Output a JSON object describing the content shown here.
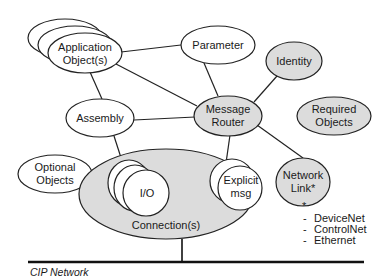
{
  "diagram": {
    "colors": {
      "required_fill": "#dcdcdc",
      "optional_fill": "#ffffff",
      "stroke": "#222222"
    },
    "nodes": {
      "application_objects": {
        "line1": "Application",
        "line2": "Object(s)"
      },
      "parameter": {
        "label": "Parameter"
      },
      "identity": {
        "label": "Identity"
      },
      "message_router": {
        "line1": "Message",
        "line2": "Router"
      },
      "required_objects": {
        "line1": "Required",
        "line2": "Objects"
      },
      "assembly": {
        "label": "Assembly"
      },
      "optional_objects": {
        "line1": "Optional",
        "line2": "Objects"
      },
      "connections": {
        "label": "Connection(s)"
      },
      "io": {
        "label": "I/O"
      },
      "explicit_msg": {
        "line1": "Explicit",
        "line2": "msg"
      },
      "network_link": {
        "line1": "Network",
        "line2": "Link*"
      }
    },
    "footnote": {
      "marker": "*",
      "items": [
        "DeviceNet",
        "ControlNet",
        "Ethernet"
      ],
      "bullet": "-"
    },
    "network": {
      "label": "CIP Network"
    },
    "edges": [
      [
        "application_objects",
        "parameter"
      ],
      [
        "application_objects",
        "message_router"
      ],
      [
        "application_objects",
        "assembly"
      ],
      [
        "parameter",
        "message_router"
      ],
      [
        "identity",
        "message_router"
      ],
      [
        "assembly",
        "message_router"
      ],
      [
        "assembly",
        "io"
      ],
      [
        "message_router",
        "explicit_msg"
      ],
      [
        "message_router",
        "network_link"
      ],
      [
        "connections",
        "cip_network"
      ]
    ]
  }
}
